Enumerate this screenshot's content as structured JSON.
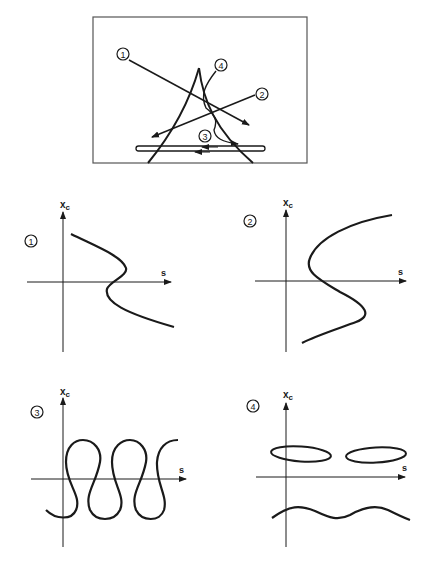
{
  "figure": {
    "top_schematic": {
      "labels": [
        "1",
        "2",
        "3",
        "4"
      ],
      "description": "Beam trajectory schematic with four labeled paths through a cusp-shaped structure and a long flat rail"
    },
    "panels": [
      {
        "id": "1",
        "y_label": "x",
        "y_label_sub": "c",
        "x_label": "s",
        "curve": "reverse-S (single fold)"
      },
      {
        "id": "2",
        "y_label": "x",
        "y_label_sub": "c",
        "x_label": "s",
        "curve": "S-shaped (single fold)"
      },
      {
        "id": "3",
        "y_label": "x",
        "y_label_sub": "c",
        "x_label": "s",
        "curve": "repeating looped wave"
      },
      {
        "id": "4",
        "y_label": "x",
        "y_label_sub": "c",
        "x_label": "s",
        "curve": "two closed ellipses above axis, wavy line below"
      }
    ]
  },
  "colors": {
    "ink": "#1a1a1a",
    "background": "#ffffff",
    "frame": "#555555"
  }
}
